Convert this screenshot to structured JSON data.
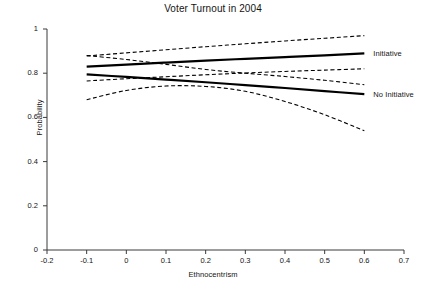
{
  "chart_data": {
    "type": "line",
    "title": "Voter Turnout in 2004",
    "xlabel": "Ethnocentrism",
    "ylabel": "Probability",
    "xlim": [
      -0.2,
      0.7
    ],
    "ylim": [
      0,
      1
    ],
    "grid": false,
    "legend_position": "right-inline",
    "xticks": [
      "-0.2",
      "-0.1",
      "0",
      "0.1",
      "0.2",
      "0.3",
      "0.4",
      "0.5",
      "0.6",
      "0.7"
    ],
    "xtick_values": [
      -0.2,
      -0.1,
      0,
      0.1,
      0.2,
      0.3,
      0.4,
      0.5,
      0.6,
      0.7
    ],
    "yticks": [
      "0",
      "0.2",
      "0.4",
      "0.6",
      "0.8",
      "1"
    ],
    "ytick_values": [
      0,
      0.2,
      0.4,
      0.6,
      0.8,
      1
    ],
    "x": [
      -0.1,
      0.0,
      0.1,
      0.2,
      0.3,
      0.4,
      0.5,
      0.6
    ],
    "series": [
      {
        "name": "Initiative",
        "style": "solid",
        "width": 2.2,
        "color": "#000000",
        "values": [
          0.83,
          0.839,
          0.848,
          0.857,
          0.865,
          0.873,
          0.881,
          0.89
        ]
      },
      {
        "name": "No Initiative",
        "style": "solid",
        "width": 2.2,
        "color": "#000000",
        "values": [
          0.795,
          0.783,
          0.771,
          0.759,
          0.746,
          0.733,
          0.719,
          0.705
        ]
      },
      {
        "name": "Initiative CI upper",
        "style": "dashed",
        "width": 1.1,
        "color": "#000000",
        "values": [
          0.878,
          0.892,
          0.906,
          0.92,
          0.933,
          0.946,
          0.958,
          0.97
        ]
      },
      {
        "name": "Initiative CI lower",
        "style": "dashed",
        "width": 1.1,
        "color": "#000000",
        "values": [
          0.765,
          0.775,
          0.784,
          0.793,
          0.801,
          0.808,
          0.814,
          0.82
        ]
      },
      {
        "name": "No Initiative CI upper",
        "style": "dashed",
        "width": 1.1,
        "color": "#000000",
        "values": [
          0.88,
          0.862,
          0.84,
          0.817,
          0.8,
          0.785,
          0.768,
          0.748
        ]
      },
      {
        "name": "No Initiative CI lower",
        "style": "dashed",
        "width": 1.1,
        "color": "#000000",
        "values": [
          0.68,
          0.722,
          0.742,
          0.74,
          0.718,
          0.672,
          0.612,
          0.54
        ]
      }
    ],
    "annotations": [
      {
        "name": "initiative-label",
        "text": "Initiative",
        "x": 0.61,
        "y": 0.885
      },
      {
        "name": "no-initiative-label",
        "text": "No Initiative",
        "x": 0.61,
        "y": 0.7
      }
    ],
    "axis_color": "#3a3a3a"
  }
}
